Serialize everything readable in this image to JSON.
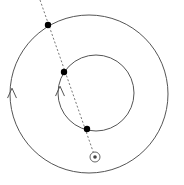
{
  "figure": {
    "background_color": "#ffffff",
    "width": 184,
    "height": 185
  },
  "chart_data": {
    "type": "scatter",
    "title": "",
    "xlabel": "",
    "ylabel": "",
    "xlim": [
      0,
      184
    ],
    "ylim": [
      0,
      185
    ],
    "grid": false,
    "legend": null,
    "coordinate_note": "Pixel coordinates, origin top-left, y increases downward",
    "orbits": [
      {
        "name": "outer-orbit",
        "shape": "circle",
        "center": [
          89,
          94
        ],
        "radius": 79,
        "stroke": "#555555",
        "stroke_width": 1,
        "direction": "counterclockwise"
      },
      {
        "name": "inner-orbit",
        "shape": "circle",
        "center": [
          96,
          93
        ],
        "radius": 38,
        "stroke": "#555555",
        "stroke_width": 1,
        "direction": "counterclockwise"
      }
    ],
    "sight_line": {
      "name": "radial-dotted-line",
      "style": "dotted",
      "stroke": "#777777",
      "stroke_width": 1,
      "dash_pattern": "2 2",
      "start": [
        40,
        0
      ],
      "end": [
        95,
        157
      ],
      "passes_through": [
        [
          48,
          25
        ],
        [
          64,
          72
        ],
        [
          87,
          129
        ]
      ]
    },
    "points": [
      {
        "name": "outer-body-point",
        "x": 48,
        "y": 25,
        "radius": 3.2,
        "color": "#000000",
        "on": "outer-orbit"
      },
      {
        "name": "inner-upper-point",
        "x": 64,
        "y": 72,
        "radius": 3.2,
        "color": "#000000",
        "on": "inner-orbit"
      },
      {
        "name": "inner-lower-point",
        "x": 87,
        "y": 129,
        "radius": 3.2,
        "color": "#000000",
        "on": "inner-orbit"
      }
    ],
    "sun": {
      "name": "sun-symbol",
      "glyph": "circled-dot",
      "x": 95,
      "y": 157,
      "outer_radius": 5,
      "inner_radius": 1.8,
      "ring_color": "#666666",
      "core_color": "#444444"
    },
    "direction_arrows": [
      {
        "name": "outer-orbit-direction-arrow",
        "x": 12,
        "y": 92,
        "points_toward": "up",
        "meaning": "counterclockwise motion"
      },
      {
        "name": "inner-orbit-direction-arrow",
        "x": 60,
        "y": 90,
        "points_toward": "up",
        "meaning": "counterclockwise motion"
      }
    ]
  }
}
